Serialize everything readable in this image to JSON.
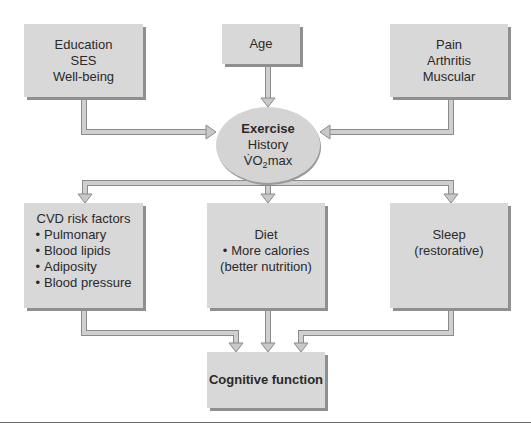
{
  "diagram": {
    "inputs": {
      "education": {
        "lines": [
          "Education",
          "SES",
          "Well-being"
        ]
      },
      "age": {
        "lines": [
          "Age"
        ]
      },
      "pain": {
        "lines": [
          "Pain",
          "Arthritis",
          "Muscular"
        ]
      }
    },
    "center": {
      "title": "Exercise",
      "line2": "History",
      "vo2_prefix": "V̇O",
      "vo2_sub": "2",
      "vo2_suffix": "max"
    },
    "mediators": {
      "cvd": {
        "title": "CVD risk factors",
        "items": [
          "Pulmonary",
          "Blood lipids",
          "Adiposity",
          "Blood pressure"
        ]
      },
      "diet": {
        "title": "Diet",
        "items": [
          "More calories"
        ],
        "extra": "(better nutrition)"
      },
      "sleep": {
        "lines": [
          "Sleep",
          "(restorative)"
        ]
      }
    },
    "outcome": {
      "label": "Cognitive function"
    },
    "colors": {
      "box_fill": "#d8d8d8",
      "box_shadow": "#8f8f8f",
      "arrow_fill": "#c8c8c8",
      "arrow_edge": "#8a8a8a"
    }
  }
}
